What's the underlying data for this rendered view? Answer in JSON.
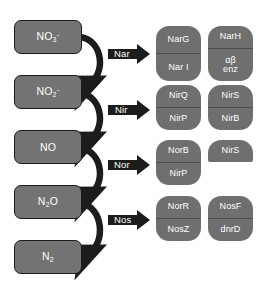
{
  "diagram": {
    "colors": {
      "substrate_fill": "#737373",
      "substrate_border": "#1c1c1c",
      "gene_fill": "#6f6f6f",
      "gene_divider": "#4d4d4d",
      "arrow_fill": "#1c1c1c",
      "text": "#ffffff",
      "background": "#ffffff"
    },
    "substrates": [
      {
        "id": "nitrate",
        "base": "NO",
        "sub": "3",
        "sup": "-",
        "plain": "NO3-"
      },
      {
        "id": "nitrite",
        "base": "NO",
        "sub": "2",
        "sup": "-",
        "plain": "NO2-"
      },
      {
        "id": "nitric-oxide",
        "base": "NO",
        "sub": "",
        "sup": "",
        "plain": "NO"
      },
      {
        "id": "nitrous-oxide",
        "base": "N",
        "sub": "2",
        "sup": "",
        "tail": "O",
        "plain": "N2O"
      },
      {
        "id": "dinitrogen",
        "base": "N",
        "sub": "2",
        "sup": "",
        "plain": "N2"
      }
    ],
    "steps": [
      {
        "id": "nar",
        "enzyme": "Nar",
        "from": "NO3-",
        "to": "NO2-",
        "gene_groups": [
          {
            "id": "nar-left",
            "cells": [
              "NarG",
              "Nar I"
            ]
          },
          {
            "id": "nar-right",
            "cells": [
              "NarH",
              "αβ|enz"
            ]
          }
        ]
      },
      {
        "id": "nir",
        "enzyme": "Nir",
        "from": "NO2-",
        "to": "NO",
        "gene_groups": [
          {
            "id": "nir-left",
            "cells": [
              "NirQ",
              "NirP"
            ]
          },
          {
            "id": "nir-right",
            "cells": [
              "NirS",
              "NirB"
            ]
          }
        ]
      },
      {
        "id": "nor",
        "enzyme": "Nor",
        "from": "NO",
        "to": "N2O",
        "gene_groups": [
          {
            "id": "nor-left",
            "cells": [
              "NorB",
              "NirP"
            ]
          },
          {
            "id": "nor-right",
            "cells": [
              "NirS"
            ]
          }
        ]
      },
      {
        "id": "nos",
        "enzyme": "Nos",
        "from": "N2O",
        "to": "N2",
        "gene_groups": [
          {
            "id": "nos-left",
            "cells": [
              "NorR",
              "NosZ"
            ]
          },
          {
            "id": "nos-right",
            "cells": [
              "NosF",
              "dnrD"
            ]
          }
        ]
      }
    ]
  }
}
